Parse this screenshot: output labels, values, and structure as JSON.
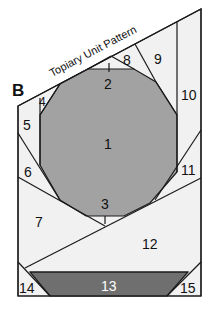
{
  "diagram": {
    "title": "Topiary Unit Pattern",
    "unit_label": "B",
    "pieces": [
      {
        "id": "1",
        "label": "1",
        "color": "#a2a2a2"
      },
      {
        "id": "2",
        "label": "2",
        "color": "#f1f1f1"
      },
      {
        "id": "3",
        "label": "3",
        "color": "#f1f1f1"
      },
      {
        "id": "4",
        "label": "4",
        "color": "#f1f1f1"
      },
      {
        "id": "5",
        "label": "5",
        "color": "#f1f1f1"
      },
      {
        "id": "6",
        "label": "6",
        "color": "#f1f1f1"
      },
      {
        "id": "7",
        "label": "7",
        "color": "#f1f1f1"
      },
      {
        "id": "8",
        "label": "8",
        "color": "#f1f1f1"
      },
      {
        "id": "9",
        "label": "9",
        "color": "#f1f1f1"
      },
      {
        "id": "10",
        "label": "10",
        "color": "#f1f1f1"
      },
      {
        "id": "11",
        "label": "11",
        "color": "#f1f1f1"
      },
      {
        "id": "12",
        "label": "12",
        "color": "#f1f1f1"
      },
      {
        "id": "13",
        "label": "13",
        "color": "#6f6f6f"
      },
      {
        "id": "14",
        "label": "14",
        "color": "#f1f1f1"
      },
      {
        "id": "15",
        "label": "15",
        "color": "#f1f1f1"
      }
    ]
  }
}
